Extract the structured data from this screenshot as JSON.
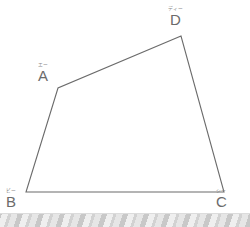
{
  "figure": {
    "type": "quadrilateral",
    "stroke_color": "#6b6b6b",
    "stroke_width": 1.1,
    "background_color": "#ffffff",
    "vertices": [
      {
        "id": "A",
        "letter": "A",
        "furigana": "エー",
        "x": 58,
        "y": 88
      },
      {
        "id": "B",
        "letter": "B",
        "furigana": "ビー",
        "x": 26,
        "y": 192
      },
      {
        "id": "C",
        "letter": "C",
        "furigana": "シー",
        "x": 224,
        "y": 192
      },
      {
        "id": "D",
        "letter": "D",
        "furigana": "ディー",
        "x": 181,
        "y": 36
      }
    ],
    "edges": [
      {
        "from": "A",
        "to": "B"
      },
      {
        "from": "B",
        "to": "C"
      },
      {
        "from": "C",
        "to": "D"
      },
      {
        "from": "D",
        "to": "A"
      }
    ],
    "path": "M 58 88 L 26 192 L 224 192 L 181 36 Z"
  },
  "bottom_band": {
    "pattern": "diagonal-stripes",
    "colors": [
      "#c8c8c8",
      "#e6e6e6",
      "#d2d2d2",
      "#efefef"
    ],
    "edge_color": "#dcdcdc"
  }
}
